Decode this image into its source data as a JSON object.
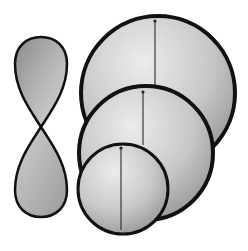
{
  "diagram": {
    "colors": {
      "background": "#ffffff",
      "outline": "#111111",
      "fill_light": "#e4e4e4",
      "fill_mid": "#bdbdbd",
      "fill_dark": "#8f8f8f",
      "axis_line": "#3a3a3a"
    },
    "figure_eight": {
      "top_lobe": {
        "cx": 41,
        "top": 37,
        "width": 52,
        "bottom_point_y": 127
      },
      "bottom_lobe": {
        "cx": 41,
        "bottom": 217,
        "width": 52,
        "top_point_y": 127
      },
      "crossing": {
        "x": 41,
        "y": 127
      }
    },
    "circles": [
      {
        "name": "large",
        "cx": 158,
        "cy": 93,
        "r": 77,
        "axis": {
          "x": 155,
          "y1": 20,
          "y2": 88
        }
      },
      {
        "name": "medium",
        "cx": 146,
        "cy": 153,
        "r": 67,
        "axis": {
          "x": 143,
          "y1": 91,
          "y2": 145
        }
      },
      {
        "name": "small",
        "cx": 123,
        "cy": 189,
        "r": 45,
        "axis": {
          "x": 121,
          "y1": 147,
          "y2": 230
        }
      }
    ]
  }
}
